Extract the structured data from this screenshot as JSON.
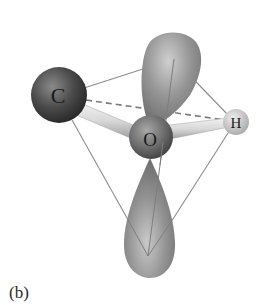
{
  "figure": {
    "caption": "(b)",
    "atoms": {
      "carbon": {
        "symbol": "C",
        "cx": 59,
        "cy": 95,
        "r": 28
      },
      "oxygen": {
        "symbol": "O",
        "cx": 151,
        "cy": 137,
        "r": 22
      },
      "hydrogen": {
        "symbol": "H",
        "cx": 236,
        "cy": 122,
        "r": 13
      }
    },
    "lone_pair_lobes": [
      {
        "name": "upper",
        "direction": "up"
      },
      {
        "name": "lower",
        "direction": "down"
      }
    ],
    "geometry": "tetrahedral",
    "colors": {
      "carbon": "#3a3a3a",
      "oxygen": "#6e6e6e",
      "hydrogen": "#c8c8c8",
      "lobe": "#8a8a8a",
      "edges": "#8c8c8c",
      "dashed": "#7a7a7a"
    }
  }
}
